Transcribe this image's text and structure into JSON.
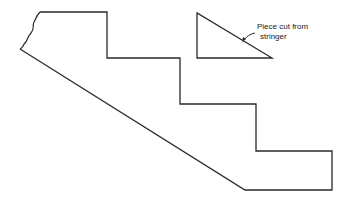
{
  "diagram": {
    "title": "",
    "stringer": {
      "description": "Stair stringer with three step cutouts and broken top-left edge"
    },
    "cut_piece": {
      "label_line1": "Piece cut from",
      "label_line2": "stringer"
    },
    "colors": {
      "stroke": "#2a2a2a",
      "background": "#ffffff"
    }
  }
}
